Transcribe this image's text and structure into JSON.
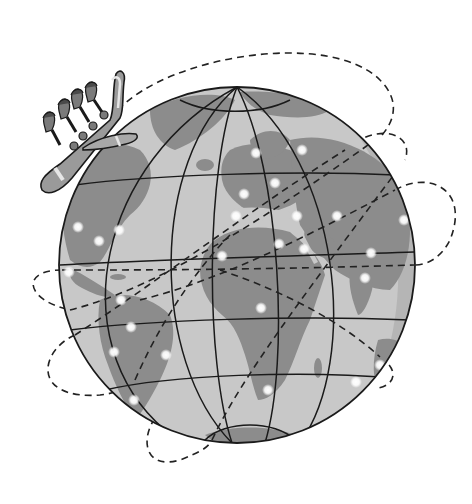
{
  "illustration": {
    "subject": "Cartoon airplane with passengers flying around a globe with dashed flight routes",
    "colors": {
      "background": "#ffffff",
      "ocean": "#c8c8c8",
      "ocean_shade": "#b4b4b4",
      "land": "#8c8c8c",
      "land_light": "#a8a8a8",
      "outline": "#1a1a1a",
      "city_light": "#ffffff",
      "plane_body": "#9a9a9a",
      "plane_stripe": "#e6e6e6"
    },
    "globe": {
      "cx": 237,
      "cy": 265,
      "r": 178
    },
    "city_light_count": 26,
    "passenger_count": 4
  }
}
